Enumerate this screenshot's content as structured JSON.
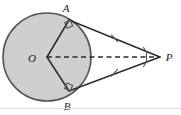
{
  "figure": {
    "width": 181,
    "height": 115,
    "background_color": "#ffffff",
    "divider_color": "#dcdcdc"
  },
  "colors": {
    "circle_fill": "#cfcfcf",
    "circle_stroke": "#585858",
    "line_stroke": "#2b2b2b",
    "dashed_stroke": "#2b2b2b",
    "marker_stroke": "#555555",
    "label_color": "#1c1c1c"
  },
  "labels": {
    "center": "O",
    "tangent_point_top": "A",
    "tangent_point_bottom": "B",
    "external_point": "P"
  },
  "geometry": {
    "circle": {
      "cx": 47,
      "cy": 57,
      "r": 44
    },
    "points": {
      "O": {
        "x": 47,
        "y": 57
      },
      "A": {
        "x": 69,
        "y": 20
      },
      "B": {
        "x": 69,
        "y": 91
      },
      "P": {
        "x": 160,
        "y": 57
      }
    },
    "label_positions": {
      "O": {
        "x": 32,
        "y": 62
      },
      "A": {
        "x": 66,
        "y": 12
      },
      "B": {
        "x": 67,
        "y": 109
      },
      "P": {
        "x": 168,
        "y": 61
      }
    }
  },
  "segments": [
    {
      "name": "radius-OA",
      "from": "O",
      "to": "A",
      "style": "solid"
    },
    {
      "name": "radius-OB",
      "from": "O",
      "to": "B",
      "style": "solid"
    },
    {
      "name": "tangent-AP",
      "from": "A",
      "to": "P",
      "style": "solid",
      "tick_marks": 1
    },
    {
      "name": "tangent-BP",
      "from": "B",
      "to": "P",
      "style": "solid",
      "tick_marks": 1
    },
    {
      "name": "segment-OP",
      "from": "O",
      "to": "P",
      "style": "dashed"
    }
  ],
  "markers": {
    "right_angle_at_A": true,
    "right_angle_at_B": true,
    "angle_marks_at_P": 2,
    "equal_length_ticks": 1
  }
}
